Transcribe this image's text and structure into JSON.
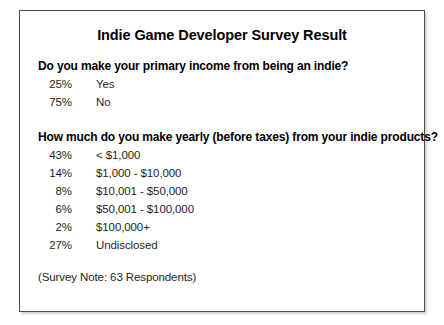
{
  "card": {
    "title": "Indie Game Developer Survey Result",
    "footer_note": "(Survey Note: 63 Respondents)",
    "border_color": "#4d4d4d",
    "background_color": "#ffffff",
    "text_color": "#231f20"
  },
  "sections": [
    {
      "heading": "Do you make your primary income from being an indie?",
      "rows": [
        {
          "percent": "25%",
          "label": "Yes"
        },
        {
          "percent": "75%",
          "label": "No"
        }
      ]
    },
    {
      "heading": "How much do you make yearly (before taxes) from your indie products?",
      "rows": [
        {
          "percent": "43%",
          "label": "< $1,000"
        },
        {
          "percent": "14%",
          "label": "$1,000 - $10,000"
        },
        {
          "percent": "8%",
          "label": "$10,001 - $50,000"
        },
        {
          "percent": "6%",
          "label": "$50,001 - $100,000"
        },
        {
          "percent": "2%",
          "label": "$100,000+"
        },
        {
          "percent": "27%",
          "label": "Undisclosed"
        }
      ]
    }
  ],
  "chart_data": {
    "type": "table",
    "title": "Indie Game Developer Survey Result",
    "annotations": [
      "(Survey Note: 63 Respondents)"
    ],
    "tables": [
      {
        "title": "Do you make your primary income from being an indie?",
        "categories": [
          "Yes",
          "No"
        ],
        "values": [
          25,
          75
        ],
        "unit": "%"
      },
      {
        "title": "How much do you make yearly (before taxes) from your indie products?",
        "categories": [
          "< $1,000",
          "$1,000 - $10,000",
          "$10,001 - $50,000",
          "$50,001 - $100,000",
          "$100,000+",
          "Undisclosed"
        ],
        "values": [
          43,
          14,
          8,
          6,
          2,
          27
        ],
        "unit": "%"
      }
    ]
  }
}
